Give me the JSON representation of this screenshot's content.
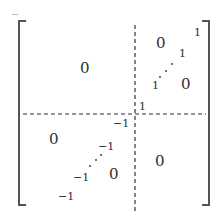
{
  "matrix": {
    "description": "Block matrix partitioned into four blocks by dashed lines",
    "top_left_block": {
      "entry": "0"
    },
    "top_right_block": {
      "zero_label": "0",
      "zero_label_lower": "0",
      "antidiagonal": [
        "1",
        "1",
        "1"
      ],
      "dots": "⋰"
    },
    "center_one": "1",
    "center_neg_one": "−1",
    "bottom_left_block": {
      "zero_label": "0",
      "zero_label_lower": "0",
      "antidiagonal": [
        "−1",
        "−1",
        "−1"
      ],
      "dots": "⋰"
    },
    "bottom_right_block": {
      "entry": "0"
    }
  },
  "colors": {
    "bracket": "#555555",
    "dashed_line": "#333333",
    "text": "#2e2e2e"
  }
}
